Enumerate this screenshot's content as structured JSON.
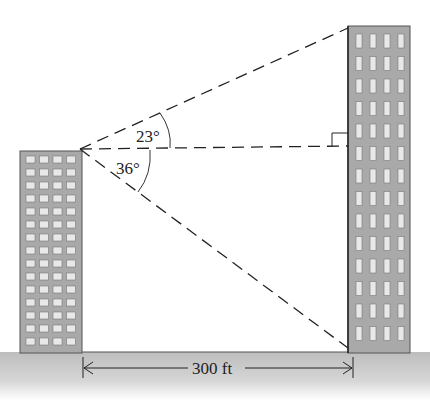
{
  "diagram": {
    "angles": {
      "elevation": "23°",
      "depression": "36°"
    },
    "distance_label": "300 ft",
    "left_building": {
      "window_rows": 15,
      "window_cols": 4
    },
    "right_building": {
      "window_rows": 14,
      "window_cols": 4
    },
    "colors": {
      "building_fill": "#a9a9a9",
      "window_fill": "#e8e8e8",
      "ground": "#c4c4c4",
      "line": "#222222"
    }
  }
}
